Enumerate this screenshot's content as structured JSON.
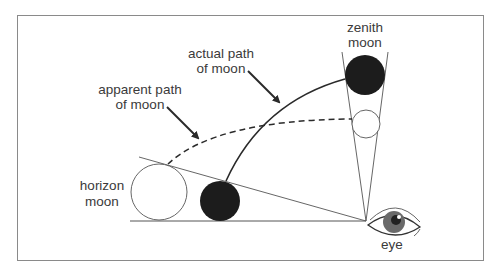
{
  "diagram": {
    "labels": {
      "actual_path": [
        "actual path",
        "of moon"
      ],
      "apparent_path": [
        "apparent path",
        "of moon"
      ],
      "zenith_moon": [
        "zenith",
        "moon"
      ],
      "horizon_moon": [
        "horizon",
        "moon"
      ],
      "eye": "eye"
    },
    "colors": {
      "frame": "#8a8a8a",
      "line": "#555555",
      "dark_moon": "#1c1c1c",
      "text": "#3a3a3a",
      "iris": "#6a6a6a"
    },
    "elements": {
      "horizon_moon": {
        "cx": 159,
        "cy": 192,
        "r": 28,
        "fill": "white"
      },
      "actual_horizon_moon": {
        "cx": 220,
        "cy": 201,
        "r": 20,
        "fill": "dark"
      },
      "zenith_moon": {
        "cx": 365,
        "cy": 75,
        "r": 20,
        "fill": "dark"
      },
      "apparent_zenith_moon": {
        "cx": 366,
        "cy": 124,
        "r": 14,
        "fill": "white"
      },
      "eye_vertex": {
        "x": 366,
        "y": 221
      }
    }
  }
}
